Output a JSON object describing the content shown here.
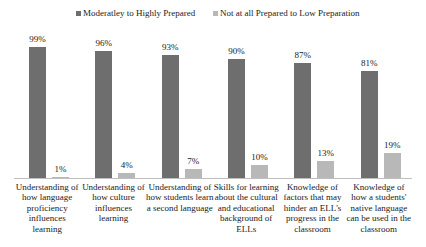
{
  "chart_data": {
    "type": "bar",
    "title": "",
    "xlabel": "",
    "ylabel": "",
    "ylim": [
      0,
      100
    ],
    "grid": false,
    "legend_position": "top",
    "categories": [
      "Understanding of how language proficiency influences learning",
      "Understanding of how culture influences learning",
      "Understanding of how students learn a second language",
      "Skills for learning about the cultural and educational background of ELLs",
      "Knowledge of factors that may hinder an ELL's progress in the classroom",
      "Knowledge of how a students' native language can be used in the classroom"
    ],
    "series": [
      {
        "name": "Moderatley to Highly Prepared",
        "color": "#6e6e6e",
        "values": [
          99,
          96,
          93,
          90,
          87,
          81
        ]
      },
      {
        "name": "Not at all Prepared to Low Preparation",
        "color": "#b8b8b8",
        "values": [
          1,
          4,
          7,
          10,
          13,
          19
        ]
      }
    ]
  },
  "legend": [
    {
      "label": "Moderatley to Highly Prepared",
      "color": "#6e6e6e"
    },
    {
      "label": "Not at all Prepared to Low Preparation",
      "color": "#b8b8b8"
    }
  ],
  "labels": {
    "dark": [
      "99%",
      "96%",
      "93%",
      "90%",
      "87%",
      "81%"
    ],
    "light": [
      "1%",
      "4%",
      "7%",
      "10%",
      "13%",
      "19%"
    ]
  }
}
